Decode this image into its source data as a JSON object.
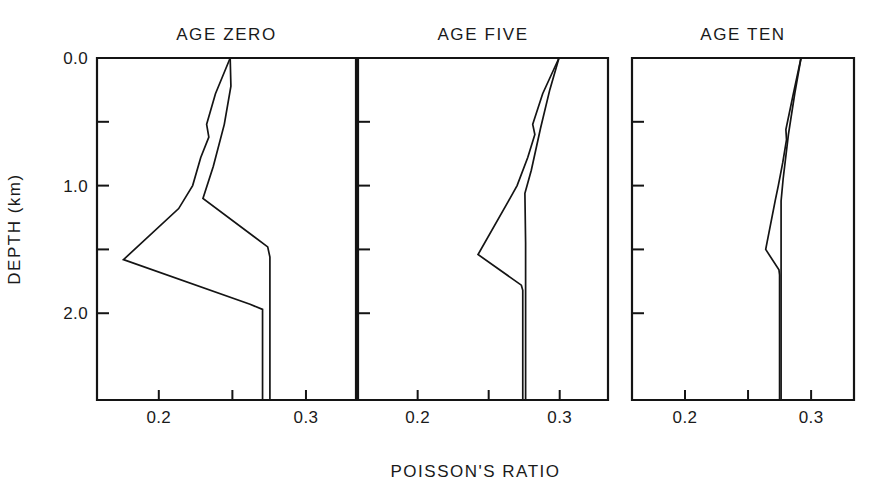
{
  "figure": {
    "background": "#ffffff",
    "ink_color": "#141414",
    "xlabel": "POISSON'S RATIO",
    "ylabel": "DEPTH (km)"
  },
  "chart_data": {
    "type": "line",
    "title": "",
    "subtitle": "",
    "xlabel": "POISSON'S RATIO",
    "ylabel": "DEPTH (km)",
    "grid": false,
    "legend": "none",
    "orientation": "depth-on-y-inverted",
    "xlim": [
      0.158,
      0.334
    ],
    "ylim": [
      0.0,
      2.68
    ],
    "y_inverted": true,
    "xticks": [
      0.2,
      0.25,
      0.3
    ],
    "xtick_labels": [
      "0.2",
      "",
      "0.3"
    ],
    "xtick_labels_shown": [
      "0.2",
      "0.3"
    ],
    "yticks": [
      0.0,
      0.5,
      1.0,
      1.5,
      2.0
    ],
    "ytick_labels": [
      "0.0",
      "",
      "1.0",
      "",
      "2.0"
    ],
    "ytick_labels_shown": [
      "0.0",
      "1.0",
      "2.0"
    ],
    "panels": [
      {
        "title": "AGE ZERO",
        "series": [
          {
            "name": "upper-branch",
            "x": [
              0.2485,
              0.2385,
              0.2325,
              0.234,
              0.2285,
              0.223,
              0.2135,
              0.176,
              0.262,
              0.2705,
              0.2705
            ],
            "y": [
              0.0,
              0.28,
              0.52,
              0.62,
              0.78,
              1.0,
              1.18,
              1.58,
              1.93,
              1.97,
              2.68
            ]
          },
          {
            "name": "lower-branch",
            "x": [
              0.2485,
              0.249,
              0.2445,
              0.237,
              0.23,
              0.274,
              0.2755,
              0.2755
            ],
            "y": [
              0.0,
              0.22,
              0.52,
              0.85,
              1.1,
              1.48,
              1.56,
              2.68
            ]
          }
        ]
      },
      {
        "title": "AGE FIVE",
        "series": [
          {
            "name": "upper-branch",
            "x": [
              0.2995,
              0.288,
              0.281,
              0.2825,
              0.2775,
              0.27,
              0.264,
              0.2425,
              0.273,
              0.274,
              0.274
            ],
            "y": [
              0.0,
              0.28,
              0.52,
              0.6,
              0.78,
              1.0,
              1.12,
              1.54,
              1.78,
              1.82,
              2.68
            ]
          },
          {
            "name": "lower-branch",
            "x": [
              0.2995,
              0.293,
              0.2865,
              0.28,
              0.2755,
              0.276,
              0.276,
              0.276
            ],
            "y": [
              0.0,
              0.25,
              0.55,
              0.88,
              1.06,
              1.45,
              1.8,
              2.68
            ]
          }
        ]
      },
      {
        "title": "AGE TEN",
        "series": [
          {
            "name": "upper-branch",
            "x": [
              0.292,
              0.2855,
              0.28,
              0.2805,
              0.2775,
              0.274,
              0.2715,
              0.264,
              0.2745,
              0.275,
              0.275
            ],
            "y": [
              0.0,
              0.3,
              0.56,
              0.64,
              0.82,
              1.0,
              1.12,
              1.5,
              1.66,
              1.7,
              2.68
            ]
          },
          {
            "name": "lower-branch",
            "x": [
              0.292,
              0.287,
              0.282,
              0.2778,
              0.2762,
              0.2762,
              0.2762
            ],
            "y": [
              0.0,
              0.28,
              0.6,
              0.95,
              1.12,
              1.7,
              2.68
            ]
          }
        ]
      }
    ]
  },
  "panel_geometry": [
    {
      "left": 97,
      "right": 356
    },
    {
      "left": 358,
      "right": 608
    },
    {
      "left": 632,
      "right": 854
    }
  ],
  "plot_geometry": {
    "top": 58,
    "bottom": 400,
    "tick_len_major": 12,
    "tick_len_minor": 10
  }
}
